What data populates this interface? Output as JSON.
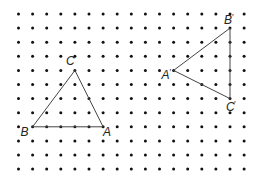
{
  "grid": {
    "origin_x": 18.5,
    "origin_y": 14,
    "spacing_x": 14.1,
    "spacing_y": 14.1,
    "cols": 17,
    "rows": 12,
    "dot_color": "#111111",
    "dot_radius": 1.5
  },
  "line_color": "#444444",
  "triangles": [
    {
      "name": "original",
      "vertices": [
        {
          "label": "A",
          "prime": "",
          "col": 6,
          "row": 8,
          "label_dx": 0,
          "label_dy": 9
        },
        {
          "label": "B",
          "prime": "",
          "col": 1,
          "row": 8,
          "label_dx": -12,
          "label_dy": 9
        },
        {
          "label": "C",
          "prime": "",
          "col": 4,
          "row": 4,
          "label_dx": -9,
          "label_dy": -5
        }
      ]
    },
    {
      "name": "image",
      "vertices": [
        {
          "label": "A",
          "prime": "′",
          "col": 11,
          "row": 4,
          "label_dx": -12,
          "label_dy": 9
        },
        {
          "label": "B",
          "prime": "′",
          "col": 15,
          "row": 1,
          "label_dx": -6,
          "label_dy": -4
        },
        {
          "label": "C",
          "prime": "′",
          "col": 15,
          "row": 6,
          "label_dx": -4,
          "label_dy": 12
        }
      ]
    }
  ]
}
